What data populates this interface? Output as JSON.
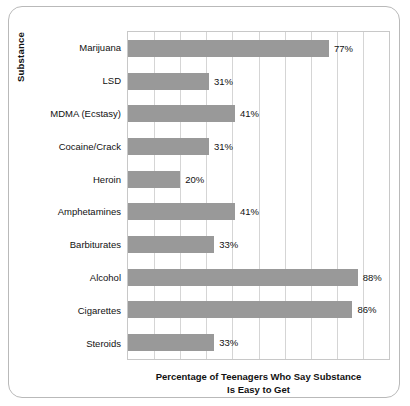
{
  "chart_data": {
    "type": "bar",
    "orientation": "horizontal",
    "title": "",
    "xlabel_line1": "Percentage of Teenagers Who Say Substance",
    "xlabel_line2": "Is Easy to Get",
    "ylabel": "Substance",
    "xlim": [
      0,
      100
    ],
    "grid": true,
    "gridlines_every": 10,
    "legend": "none",
    "xtick_labels": [],
    "bar_color": "#999999",
    "categories": [
      "Marijuana",
      "LSD",
      "MDMA (Ecstasy)",
      "Cocaine/Crack",
      "Heroin",
      "Amphetamines",
      "Barbiturates",
      "Alcohol",
      "Cigarettes",
      "Steroids"
    ],
    "values": [
      77,
      31,
      41,
      31,
      20,
      41,
      33,
      88,
      86,
      33
    ],
    "data_labels": [
      "77%",
      "31%",
      "41%",
      "31%",
      "20%",
      "41%",
      "33%",
      "88%",
      "86%",
      "33%"
    ]
  }
}
